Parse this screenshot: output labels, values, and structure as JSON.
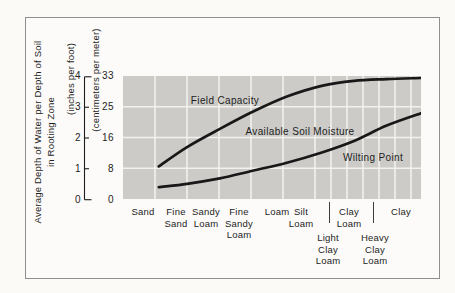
{
  "figure": {
    "border_color": "#8f8f8f",
    "plot_bg": "#cccbc7",
    "grid_color": "#f2f1ed",
    "curve_color": "#181818",
    "text_color": "#1d1d1d",
    "y_axis": {
      "title_line1": "Average Depth of Water per Depth of Soil",
      "title_line2": "in Rooting Zone",
      "unit_inches": "(inches per foot)",
      "unit_cm": "(centimeters per meter)",
      "inch_ticks": [
        "4",
        "3",
        "2",
        "1",
        "0"
      ],
      "cm_ticks": [
        "33",
        "25",
        "16",
        "8",
        "0"
      ]
    },
    "labels": {
      "field_capacity": "Field Capacity",
      "available_soil_moisture": "Available Soil Moisture",
      "wilting_point": "Wilting Point"
    }
  },
  "chart_data": {
    "type": "line",
    "title": "",
    "ylabel": "Average Depth of Water per Depth of Soil in Rooting Zone",
    "y_axis_units": [
      "inches per foot",
      "centimeters per meter"
    ],
    "ylim_inches": [
      0,
      4
    ],
    "ylim_cm": [
      0,
      33
    ],
    "inch_ticks": [
      4,
      3,
      2,
      1,
      0
    ],
    "cm_ticks": [
      33,
      25,
      16,
      8,
      0
    ],
    "grid": true,
    "x_categories": [
      "Sand",
      "Fine Sand",
      "Sandy Loam",
      "Fine Sandy Loam",
      "Loam",
      "Silt Loam",
      "Light Clay Loam",
      "Clay Loam",
      "Heavy Clay Loam",
      "Clay"
    ],
    "x_fractions": [
      0.12,
      0.215,
      0.325,
      0.435,
      0.55,
      0.67,
      0.775,
      0.885,
      1.0
    ],
    "series": [
      {
        "name": "Field Capacity",
        "units": "centimeters per meter",
        "values_cm": [
          8.7,
          14,
          19,
          23.7,
          27.9,
          30.9,
          32.2,
          32.7,
          33
        ]
      },
      {
        "name": "Wilting Point",
        "units": "centimeters per meter",
        "values_cm": [
          3,
          3.9,
          5.4,
          7.5,
          9.7,
          12.6,
          15.7,
          19.9,
          23.3
        ]
      }
    ],
    "region_annotation": "Available Soil Moisture",
    "x_label_layout": [
      {
        "lines": [
          "Sand"
        ],
        "x": 20,
        "row": 1
      },
      {
        "lines": [
          "Fine",
          "Sand"
        ],
        "x": 53,
        "row": 1
      },
      {
        "lines": [
          "Sandy",
          "Loam"
        ],
        "x": 83,
        "row": 1
      },
      {
        "lines": [
          "Fine",
          "Sandy",
          "Loam"
        ],
        "x": 116,
        "row": 1
      },
      {
        "lines": [
          "Loam"
        ],
        "x": 154,
        "row": 1
      },
      {
        "lines": [
          "Silt",
          "Loam"
        ],
        "x": 178,
        "row": 1
      },
      {
        "lines": [
          "Light",
          "Clay",
          "Loam"
        ],
        "x": 205,
        "row": 2
      },
      {
        "lines": [
          "Clay",
          "Loam"
        ],
        "x": 226,
        "row": 1
      },
      {
        "lines": [
          "Heavy",
          "Clay",
          "Loam"
        ],
        "x": 252,
        "row": 2
      },
      {
        "lines": [
          "Clay"
        ],
        "x": 278,
        "row": 1
      }
    ],
    "separator_x": [
      205.5,
      249.5
    ]
  }
}
